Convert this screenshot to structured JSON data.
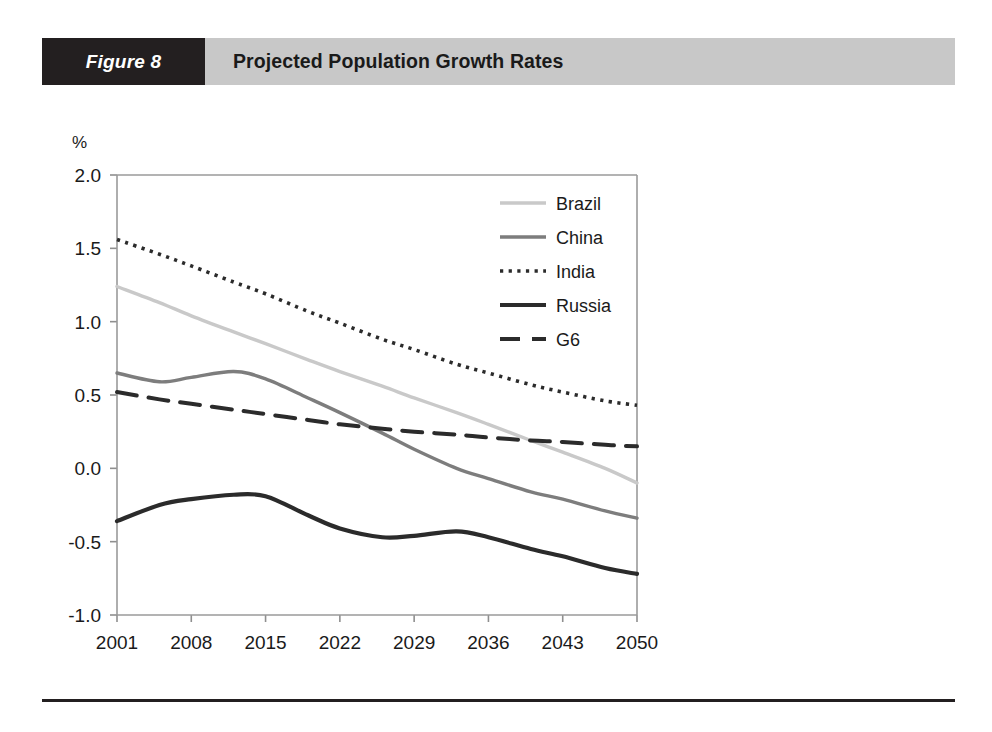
{
  "figure": {
    "number_label": "Figure 8",
    "title": "Projected Population Growth Rates"
  },
  "chart_data": {
    "type": "line",
    "title": "Projected Population Growth Rates",
    "xlabel": "",
    "ylabel": "%",
    "unit_label": "%",
    "xlim": [
      2001,
      2050
    ],
    "ylim": [
      -1.0,
      2.0
    ],
    "ytick_labels": [
      "2.0",
      "1.5",
      "1.0",
      "0.5",
      "0.0",
      "-0.5",
      "-1.0"
    ],
    "yticks": [
      2.0,
      1.5,
      1.0,
      0.5,
      0.0,
      -0.5,
      -1.0
    ],
    "xtick_labels": [
      "2001",
      "2008",
      "2015",
      "2022",
      "2029",
      "2036",
      "2043",
      "2050"
    ],
    "xticks": [
      2001,
      2008,
      2015,
      2022,
      2029,
      2036,
      2043,
      2050
    ],
    "grid": false,
    "legend_position": "top-right",
    "x": [
      2001,
      2005,
      2008,
      2012,
      2015,
      2019,
      2022,
      2026,
      2029,
      2033,
      2036,
      2040,
      2043,
      2047,
      2050
    ],
    "series": [
      {
        "name": "Brazil",
        "style": "solid",
        "color": "#c9c9c9",
        "width": 3.4,
        "values": [
          1.24,
          1.13,
          1.04,
          0.93,
          0.85,
          0.74,
          0.66,
          0.56,
          0.48,
          0.38,
          0.3,
          0.19,
          0.11,
          0.0,
          -0.1
        ]
      },
      {
        "name": "China",
        "style": "solid",
        "color": "#7d7d7d",
        "width": 3.4,
        "values": [
          0.65,
          0.59,
          0.62,
          0.66,
          0.61,
          0.48,
          0.38,
          0.24,
          0.13,
          0.0,
          -0.07,
          -0.16,
          -0.21,
          -0.29,
          -0.34
        ]
      },
      {
        "name": "India",
        "style": "dotted",
        "color": "#2b2b2b",
        "width": 3.6,
        "values": [
          1.56,
          1.46,
          1.38,
          1.27,
          1.19,
          1.07,
          0.99,
          0.88,
          0.81,
          0.71,
          0.65,
          0.57,
          0.52,
          0.46,
          0.43
        ]
      },
      {
        "name": "Russia",
        "style": "solid",
        "color": "#2b2b2b",
        "width": 4.2,
        "values": [
          -0.36,
          -0.25,
          -0.21,
          -0.18,
          -0.19,
          -0.32,
          -0.41,
          -0.47,
          -0.46,
          -0.43,
          -0.47,
          -0.55,
          -0.6,
          -0.68,
          -0.72
        ]
      },
      {
        "name": "G6",
        "style": "dashed",
        "color": "#2b2b2b",
        "width": 4.0,
        "values": [
          0.52,
          0.47,
          0.44,
          0.4,
          0.37,
          0.33,
          0.3,
          0.27,
          0.25,
          0.23,
          0.21,
          0.19,
          0.18,
          0.16,
          0.15
        ]
      }
    ]
  }
}
